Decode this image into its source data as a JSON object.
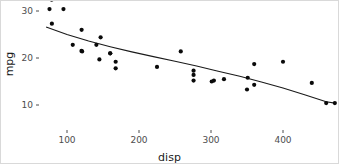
{
  "chart_data": {
    "type": "scatter",
    "title": "",
    "xlabel": "disp",
    "ylabel": "mpg",
    "xlim": [
      45,
      485
    ],
    "ylim": [
      8.5,
      34.5
    ],
    "grid": false,
    "legend": null,
    "x_ticks": [
      100,
      200,
      300,
      400
    ],
    "y_ticks": [
      30,
      20,
      10
    ],
    "point_color": "#0a0a0a",
    "line_color": "#1a1a1a",
    "background_color": "#ffffff",
    "axis_text_color": "#4d4d4d",
    "series": [
      {
        "name": "mtcars",
        "x": [
          160,
          160,
          108,
          258,
          360,
          225,
          360,
          146.7,
          140.8,
          167.6,
          167.6,
          275.8,
          275.8,
          275.8,
          472,
          460,
          440,
          78.7,
          75.7,
          71.1,
          120.1,
          318,
          304,
          350,
          400,
          79,
          120.3,
          95.1,
          351,
          145,
          301,
          121
        ],
        "y": [
          21.0,
          21.0,
          22.8,
          21.4,
          18.7,
          18.1,
          14.3,
          24.4,
          22.8,
          19.2,
          17.8,
          16.4,
          17.3,
          15.2,
          10.4,
          10.4,
          14.7,
          32.4,
          30.4,
          33.9,
          21.5,
          15.5,
          15.2,
          13.3,
          19.2,
          27.3,
          26.0,
          30.4,
          15.8,
          19.7,
          15.0,
          21.4
        ]
      }
    ],
    "smooth": {
      "method": "loess",
      "x": [
        71,
        100,
        130,
        160,
        190,
        220,
        250,
        280,
        310,
        340,
        370,
        400,
        430,
        460,
        472
      ],
      "y": [
        26.6,
        25.0,
        23.6,
        22.4,
        21.3,
        20.3,
        19.3,
        18.3,
        17.2,
        16.1,
        14.9,
        13.6,
        12.2,
        10.7,
        10.4
      ]
    }
  },
  "axis": {
    "x_title": "disp",
    "y_title": "mpg",
    "x_tick_labels": [
      "100",
      "200",
      "300",
      "400"
    ],
    "y_tick_labels": [
      "30",
      "20",
      "10"
    ]
  }
}
